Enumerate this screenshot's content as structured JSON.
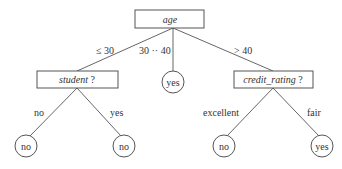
{
  "diagram": {
    "type": "decision-tree",
    "root": {
      "label": "age",
      "italic": true
    },
    "edges_root": [
      {
        "label": "≤ 30",
        "target": "student ?"
      },
      {
        "label": "30 ·· 40",
        "target": "yes"
      },
      {
        "label": "> 40",
        "target": "credit_rating ?"
      }
    ],
    "nodes": {
      "student": {
        "name": "student",
        "suffix": " ?"
      },
      "middle_leaf": {
        "label": "yes"
      },
      "credit": {
        "name": "credit_rating",
        "suffix": " ?"
      }
    },
    "student_edges": [
      {
        "label": "no",
        "leaf": "no"
      },
      {
        "label": "yes",
        "leaf": "no"
      }
    ],
    "credit_edges": [
      {
        "label": "excellent",
        "leaf": "no"
      },
      {
        "label": "fair",
        "leaf": "yes"
      }
    ]
  }
}
